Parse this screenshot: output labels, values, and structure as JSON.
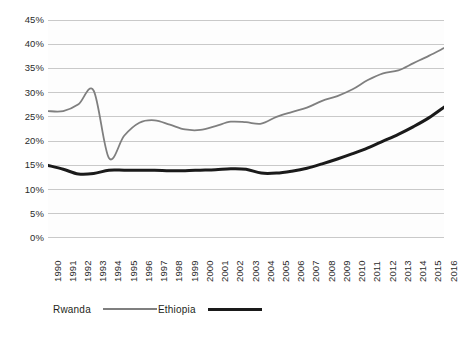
{
  "chart_data": {
    "type": "line",
    "title": "",
    "subtitle": "",
    "xlabel": "",
    "ylabel": "",
    "x": [
      1990,
      1991,
      1992,
      1993,
      1994,
      1995,
      1996,
      1997,
      1998,
      1999,
      2000,
      2001,
      2002,
      2003,
      2004,
      2005,
      2006,
      2007,
      2008,
      2009,
      2010,
      2011,
      2012,
      2013,
      2014,
      2015,
      2016
    ],
    "xtick_labels": [
      "1990",
      "1991",
      "1992",
      "1993",
      "1994",
      "1995",
      "1996",
      "1997",
      "1998",
      "1999",
      "2000",
      "2001",
      "2002",
      "2003",
      "2004",
      "2005",
      "2006",
      "2007",
      "2008",
      "2009",
      "2010",
      "2011",
      "2012",
      "2013",
      "2014",
      "2015",
      "2016"
    ],
    "ytick_labels": [
      "45%",
      "40%",
      "35%",
      "30%",
      "25%",
      "20%",
      "15%",
      "10%",
      "5%",
      "0%"
    ],
    "ytick_values": [
      45,
      40,
      35,
      30,
      25,
      20,
      15,
      10,
      5,
      0
    ],
    "ylim": [
      0,
      45
    ],
    "y_unit": "%",
    "grid": "horizontal",
    "legend_position": "bottom",
    "series": [
      {
        "name": "Rwanda",
        "color": "#7f7f7f",
        "line_width": 1.8,
        "values": [
          26.2,
          26.2,
          27.6,
          30.4,
          16.5,
          21.1,
          23.8,
          24.3,
          23.4,
          22.4,
          22.3,
          23.1,
          24.0,
          23.9,
          23.6,
          25.0,
          26.0,
          26.9,
          28.3,
          29.3,
          30.7,
          32.6,
          34.0,
          34.6,
          36.1,
          37.6,
          39.2
        ]
      },
      {
        "name": "Ethiopia",
        "color": "#1a1a1a",
        "line_width": 3.0,
        "values": [
          15.0,
          14.2,
          13.2,
          13.3,
          14.0,
          14.0,
          14.0,
          14.0,
          13.9,
          13.9,
          14.0,
          14.1,
          14.3,
          14.2,
          13.4,
          13.4,
          13.8,
          14.4,
          15.3,
          16.3,
          17.4,
          18.6,
          20.0,
          21.4,
          23.0,
          24.8,
          27.0
        ]
      }
    ],
    "legend": [
      {
        "label": "Rwanda",
        "color": "#7f7f7f",
        "line_width": 2
      },
      {
        "label": "Ethiopia",
        "color": "#1a1a1a",
        "line_width": 3
      }
    ]
  },
  "plot": {
    "background": "#fdfdfd",
    "gridline_color": "#c9c9c9"
  }
}
